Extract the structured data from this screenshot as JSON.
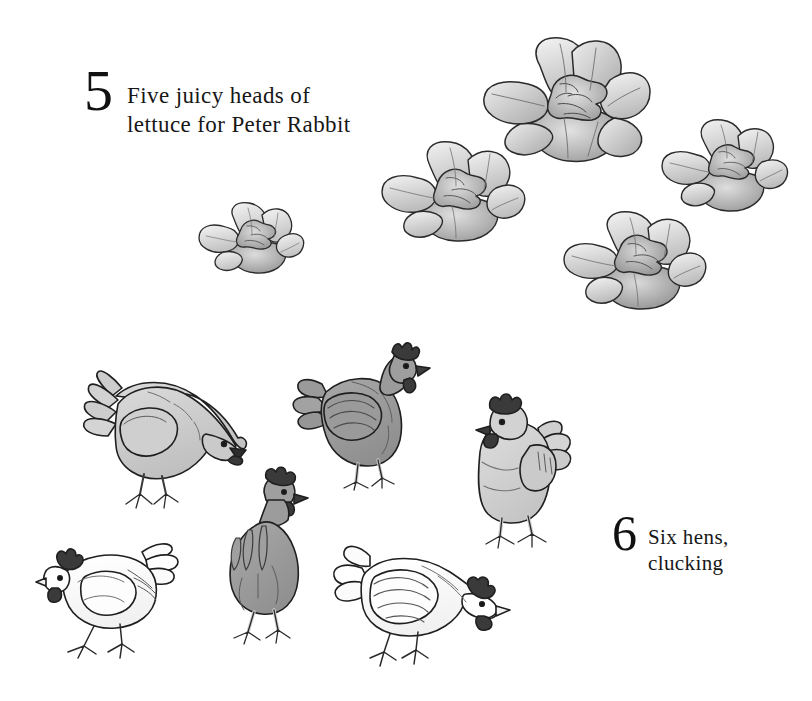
{
  "page": {
    "background_color": "#ffffff",
    "width": 812,
    "height": 701,
    "kind": "counting-book-page"
  },
  "entries": [
    {
      "numeral": "5",
      "caption": "Five juicy heads of\nlettuce for Peter Rabbit",
      "subject": "lettuce",
      "count": 5
    },
    {
      "numeral": "6",
      "caption": "Six hens,\nclucking",
      "subject": "hens",
      "count": 6
    }
  ],
  "block_five": {
    "numeral": "5",
    "caption": "Five juicy heads of\nlettuce for Peter Rabbit"
  },
  "block_six": {
    "numeral": "6",
    "caption": "Six hens,\nclucking"
  },
  "palette": {
    "ink": "#1a1a1a",
    "text": "#171717",
    "paper": "#ffffff",
    "leaf_light": "#f0f0f0",
    "leaf_mid": "#cfcfcf",
    "leaf_dark": "#9d9d9d",
    "leaf_core": "#b8b8b8",
    "hen_light": "#cfcfcf",
    "hen_mid": "#9a9a9a",
    "hen_pale": "#d8d8d8",
    "hen_white": "#fbfbfb",
    "comb_dark": "#3a3a3a",
    "leg_pale": "#ececec"
  },
  "lettuces": [
    {
      "name": "lettuce-top-right",
      "label": "head of lettuce"
    },
    {
      "name": "lettuce-upper-middle",
      "label": "head of lettuce"
    },
    {
      "name": "lettuce-far-right",
      "label": "head of lettuce"
    },
    {
      "name": "lettuce-lower-right",
      "label": "head of lettuce"
    },
    {
      "name": "lettuce-small-left",
      "label": "head of lettuce"
    }
  ],
  "hens": [
    {
      "name": "hen-pecking-left",
      "pose": "pecking, head down, facing right",
      "tone": "light gray"
    },
    {
      "name": "hen-standing-center",
      "pose": "standing, facing right",
      "tone": "mid gray"
    },
    {
      "name": "hen-facing-front-right",
      "pose": "standing, facing viewer",
      "tone": "pale gray"
    },
    {
      "name": "hen-rear-center",
      "pose": "rear view, facing away",
      "tone": "mid gray"
    },
    {
      "name": "hen-white-left",
      "pose": "pecking, facing left",
      "tone": "white"
    },
    {
      "name": "hen-white-bottom",
      "pose": "pecking, facing right",
      "tone": "white"
    }
  ]
}
